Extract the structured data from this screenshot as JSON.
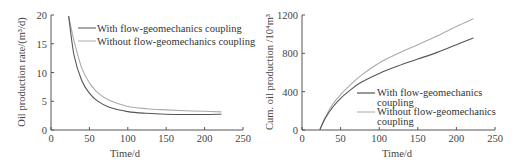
{
  "chart_data": [
    {
      "type": "line",
      "title": "",
      "xlabel": "Time/d",
      "ylabel": "Oil production rate/(m³/d)",
      "xlim": [
        0,
        250
      ],
      "ylim": [
        0,
        20
      ],
      "xticks": [
        0,
        50,
        100,
        150,
        200,
        250
      ],
      "yticks": [
        0,
        5,
        10,
        15,
        20
      ],
      "grid": false,
      "legend_position": "upper right",
      "x": [
        23,
        30,
        40,
        50,
        60,
        75,
        100,
        125,
        150,
        175,
        200,
        222
      ],
      "series": [
        {
          "name": "With flow-geomechanics coupling",
          "color": "#555555",
          "values": [
            19.8,
            13.0,
            8.6,
            6.4,
            5.1,
            4.0,
            3.2,
            2.9,
            2.75,
            2.7,
            2.7,
            2.75
          ]
        },
        {
          "name": "Without flow-geomechanics coupling",
          "color": "#aaaaaa",
          "values": [
            19.8,
            15.5,
            10.8,
            8.2,
            6.6,
            5.2,
            4.1,
            3.7,
            3.5,
            3.35,
            3.25,
            3.15
          ]
        }
      ]
    },
    {
      "type": "line",
      "title": "",
      "xlabel": "Time/d",
      "ylabel": "Cum. oil production /10⁴m³",
      "xlim": [
        0,
        250
      ],
      "ylim": [
        0,
        1200
      ],
      "xticks": [
        0,
        50,
        100,
        150,
        200,
        250
      ],
      "yticks": [
        0,
        400,
        800,
        1200
      ],
      "grid": false,
      "legend_position": "lower right",
      "x": [
        23,
        30,
        40,
        50,
        60,
        75,
        100,
        125,
        150,
        175,
        200,
        222
      ],
      "series": [
        {
          "name": "With flow-geomechanics coupling",
          "color": "#555555",
          "values": [
            0,
            120,
            240,
            330,
            400,
            490,
            590,
            670,
            740,
            810,
            890,
            960
          ]
        },
        {
          "name": "Without flow-geomechanics coupling",
          "color": "#aaaaaa",
          "values": [
            0,
            130,
            270,
            370,
            450,
            560,
            700,
            800,
            890,
            980,
            1080,
            1160
          ]
        }
      ]
    }
  ],
  "left": {
    "ylabel": "Oil production rate/(m³/d)",
    "xlabel": "Time/d",
    "legend": [
      "With flow-geomechanics coupling",
      "Without flow-geomechanics coupling"
    ]
  },
  "right": {
    "ylabel": "Cum. oil production /10⁴m³",
    "xlabel": "Time/d",
    "legend_with_1": "With flow-geomechanics",
    "legend_with_2": "coupling",
    "legend_without_1": "Without flow-geomechanics",
    "legend_without_2": "coupling"
  }
}
